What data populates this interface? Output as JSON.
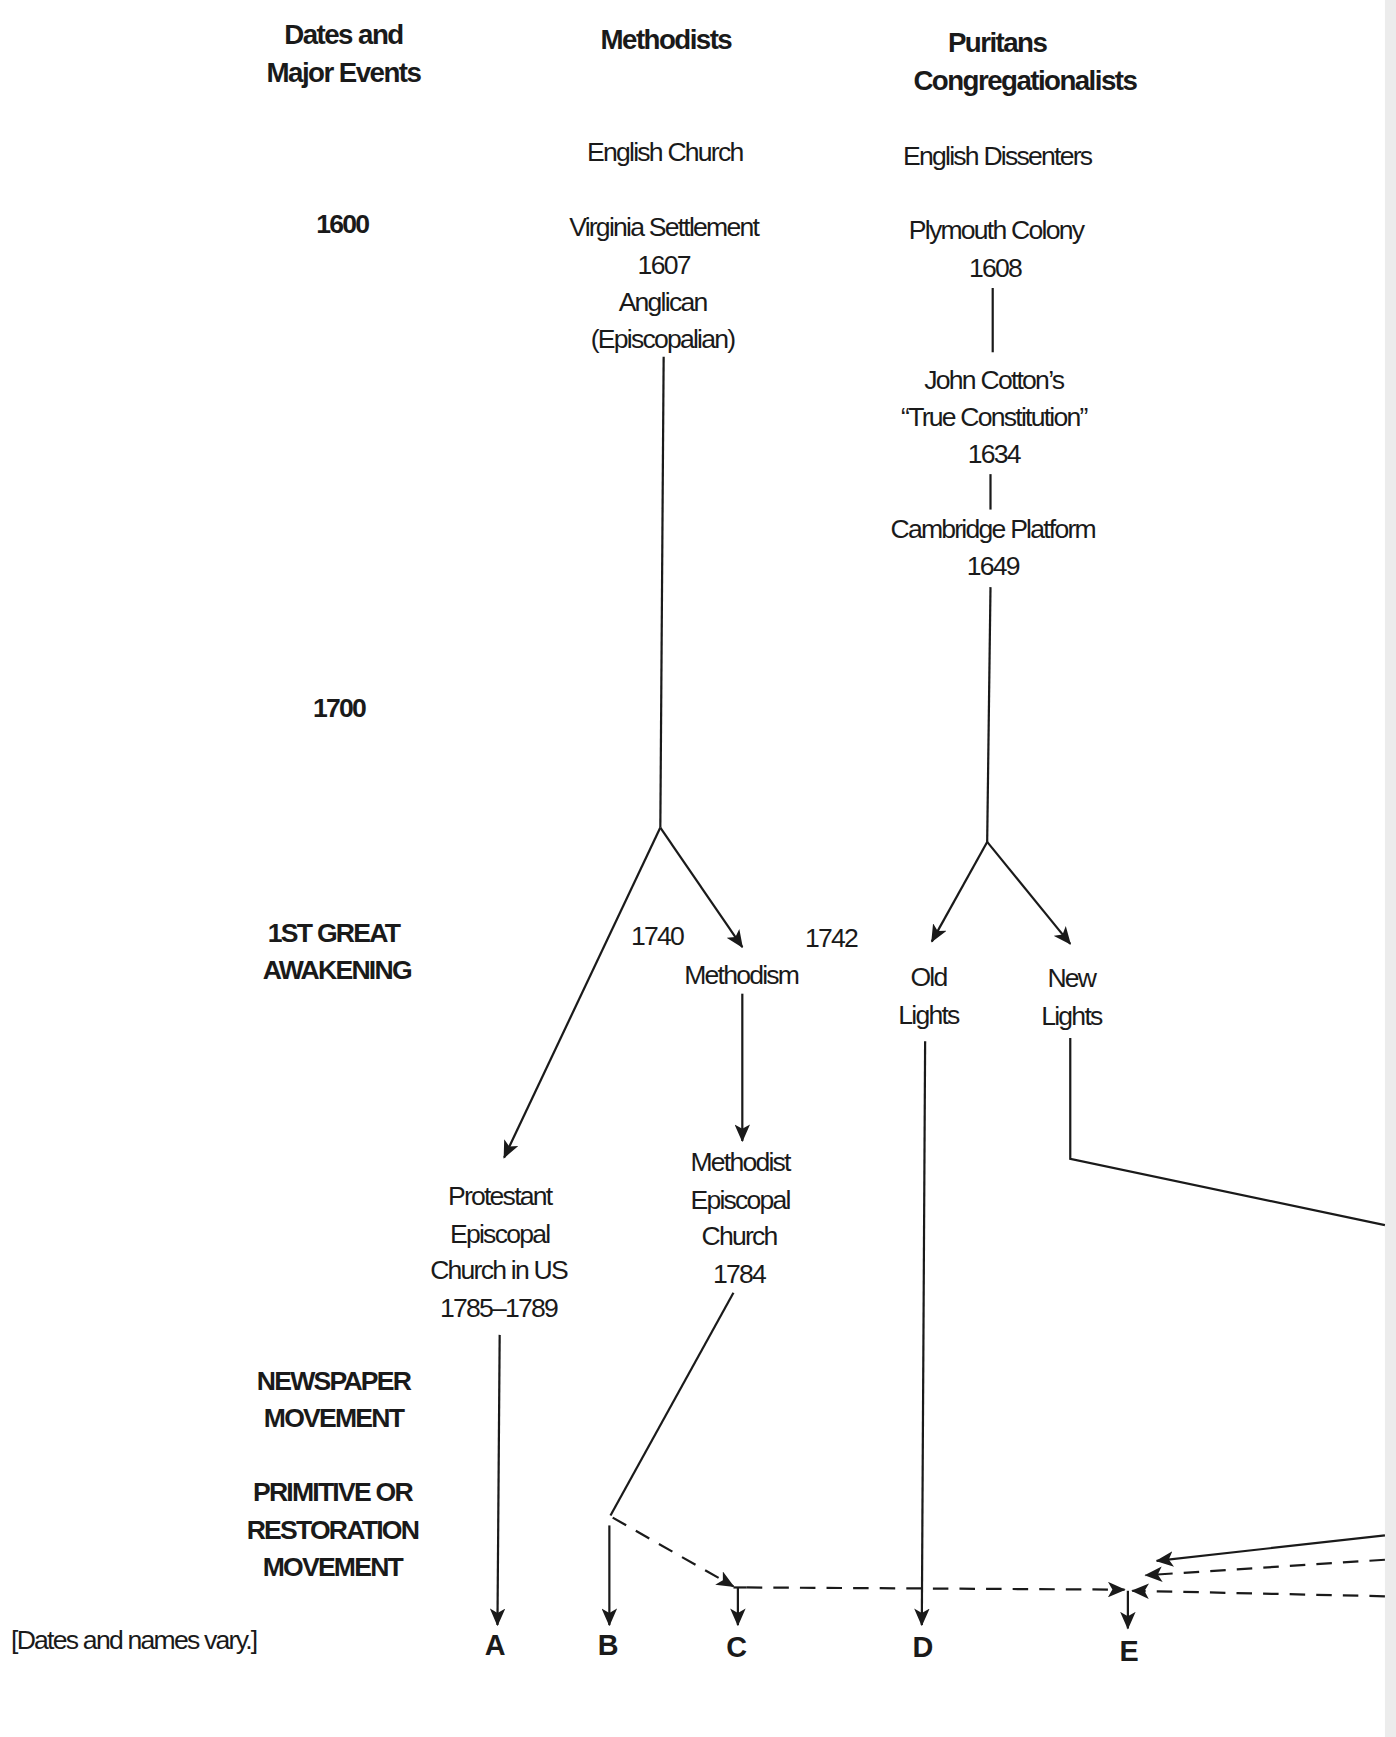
{
  "headers": {
    "dates": [
      "Dates and",
      "Major Events"
    ],
    "methodists": "Methodists",
    "puritans": [
      "Puritans",
      "Congregationalists"
    ]
  },
  "timeline": {
    "y1600": "1600",
    "y1700": "1700",
    "great_awakening": [
      "1ST GREAT",
      "AWAKENING"
    ],
    "newspaper": [
      "NEWSPAPER",
      "MOVEMENT"
    ],
    "restoration": [
      "PRIMITIVE OR",
      "RESTORATION",
      "MOVEMENT"
    ]
  },
  "methodists_column": {
    "english_church": "English Church",
    "virginia": [
      "Virginia Settlement",
      "1607",
      "Anglican",
      "(Episcopalian)"
    ],
    "year_1740": "1740",
    "year_1742": "1742",
    "methodism": "Methodism",
    "protestant_episcopal": [
      "Protestant",
      "Episcopal",
      "Church in US",
      "1785–1789"
    ],
    "methodist_episcopal": [
      "Methodist",
      "Episcopal",
      "Church",
      "1784"
    ]
  },
  "puritans_column": {
    "english_dissenters": "English Dissenters",
    "plymouth": [
      "Plymouth Colony",
      "1608"
    ],
    "cotton": [
      "John Cotton’s",
      "“True Constitution”",
      "1634"
    ],
    "cambridge": [
      "Cambridge Platform",
      "1649"
    ],
    "old_lights": [
      "Old",
      "Lights"
    ],
    "new_lights": [
      "New",
      "Lights"
    ]
  },
  "endpoints": [
    "A",
    "B",
    "C",
    "D",
    "E"
  ],
  "footnote": "[Dates and names vary.]",
  "colors": {
    "ink": "#1a1a1a",
    "background": "#ffffff"
  }
}
